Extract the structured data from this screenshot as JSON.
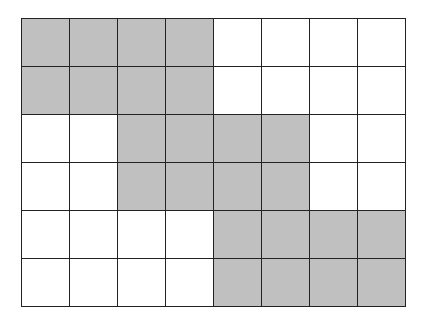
{
  "grid": {
    "rows": 6,
    "cols": 8,
    "fill_color": "#c0c0c0",
    "empty_color": "#ffffff",
    "line_color": "#222222",
    "cells": [
      [
        1,
        1,
        1,
        1,
        0,
        0,
        0,
        0
      ],
      [
        1,
        1,
        1,
        1,
        0,
        0,
        0,
        0
      ],
      [
        0,
        0,
        1,
        1,
        1,
        1,
        0,
        0
      ],
      [
        0,
        0,
        1,
        1,
        1,
        1,
        0,
        0
      ],
      [
        0,
        0,
        0,
        0,
        1,
        1,
        1,
        1
      ],
      [
        0,
        0,
        0,
        0,
        1,
        1,
        1,
        1
      ]
    ]
  }
}
